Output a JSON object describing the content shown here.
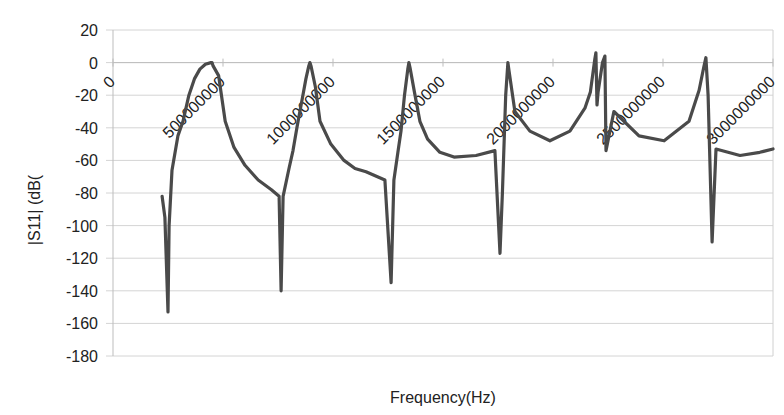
{
  "chart_data": {
    "type": "line",
    "title": "",
    "xlabel": "Frequency(Hz)",
    "ylabel": "|S11| (dB(",
    "xlim": [
      0,
      3000000000
    ],
    "ylim": [
      -180,
      20
    ],
    "grid": {
      "y": true,
      "x": false
    },
    "legend": null,
    "y_ticks": [
      20,
      0,
      -20,
      -40,
      -60,
      -80,
      -100,
      -120,
      -140,
      -160,
      -180
    ],
    "x_tick_labels": [
      "0",
      "500000000",
      "1000000000",
      "1500000000",
      "2000000000",
      "2500000000",
      "3000000000"
    ],
    "x_tick_values": [
      0,
      500000000,
      1000000000,
      1500000000,
      2000000000,
      2500000000,
      3000000000
    ],
    "series": [
      {
        "name": "|S11|",
        "color": "#4a4a4a",
        "x_unit": "MHz",
        "points": [
          [
            223,
            -82
          ],
          [
            236,
            -95
          ],
          [
            250,
            -153
          ],
          [
            255,
            -100
          ],
          [
            268,
            -66
          ],
          [
            295,
            -45
          ],
          [
            318,
            -36
          ],
          [
            345,
            -20
          ],
          [
            370,
            -10
          ],
          [
            395,
            -4
          ],
          [
            420,
            -1
          ],
          [
            445,
            0
          ],
          [
            450,
            0
          ],
          [
            455,
            -2
          ],
          [
            480,
            -8
          ],
          [
            510,
            -36
          ],
          [
            550,
            -52
          ],
          [
            600,
            -63
          ],
          [
            660,
            -72
          ],
          [
            720,
            -78
          ],
          [
            755,
            -82
          ],
          [
            764,
            -140
          ],
          [
            773,
            -82
          ],
          [
            800,
            -65
          ],
          [
            818,
            -54
          ],
          [
            836,
            -40
          ],
          [
            863,
            -20
          ],
          [
            877,
            -10
          ],
          [
            890,
            -2
          ],
          [
            895,
            0
          ],
          [
            900,
            -2
          ],
          [
            920,
            -15
          ],
          [
            941,
            -36
          ],
          [
            990,
            -50
          ],
          [
            1050,
            -60
          ],
          [
            1100,
            -65
          ],
          [
            1150,
            -67
          ],
          [
            1236,
            -72
          ],
          [
            1264,
            -135
          ],
          [
            1277,
            -72
          ],
          [
            1295,
            -55
          ],
          [
            1309,
            -42
          ],
          [
            1325,
            -20
          ],
          [
            1340,
            -4
          ],
          [
            1345,
            0
          ],
          [
            1350,
            -3
          ],
          [
            1370,
            -18
          ],
          [
            1395,
            -36
          ],
          [
            1430,
            -47
          ],
          [
            1486,
            -55
          ],
          [
            1550,
            -58
          ],
          [
            1650,
            -57
          ],
          [
            1736,
            -54
          ],
          [
            1759,
            -117
          ],
          [
            1770,
            -80
          ],
          [
            1785,
            -20
          ],
          [
            1795,
            0
          ],
          [
            1800,
            -5
          ],
          [
            1827,
            -30
          ],
          [
            1895,
            -42
          ],
          [
            1986,
            -48
          ],
          [
            2077,
            -42
          ],
          [
            2145,
            -28
          ],
          [
            2170,
            -18
          ],
          [
            2190,
            2
          ],
          [
            2195,
            6
          ],
          [
            2200,
            -26
          ],
          [
            2205,
            -18
          ],
          [
            2225,
            0
          ],
          [
            2236,
            4
          ],
          [
            2241,
            -54
          ],
          [
            2277,
            -30
          ],
          [
            2391,
            -45
          ],
          [
            2505,
            -48
          ],
          [
            2618,
            -36
          ],
          [
            2664,
            -17
          ],
          [
            2685,
            -3
          ],
          [
            2695,
            3
          ],
          [
            2705,
            -20
          ],
          [
            2723,
            -110
          ],
          [
            2741,
            -53
          ],
          [
            2850,
            -57
          ],
          [
            2940,
            -55
          ],
          [
            3000,
            -53
          ]
        ]
      }
    ]
  },
  "axes": {
    "y_title": "|S11| (dB(",
    "x_title": "Frequency(Hz)"
  }
}
